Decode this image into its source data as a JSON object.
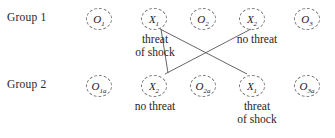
{
  "diagram": {
    "type": "experimental-design-crossover-diagram",
    "rows": [
      {
        "label": "Group 1",
        "label_x": 7,
        "label_y": 11,
        "node_y": 8,
        "nodes": [
          {
            "name": "o1",
            "base": "O",
            "sub": "1",
            "x": 86
          },
          {
            "name": "x1",
            "base": "X",
            "sub": "1",
            "x": 141
          },
          {
            "name": "o2",
            "base": "O",
            "sub": "2",
            "x": 190
          },
          {
            "name": "x2",
            "base": "X",
            "sub": "2",
            "x": 239
          },
          {
            "name": "o3",
            "base": "O",
            "sub": "3",
            "x": 294
          }
        ]
      },
      {
        "label": "Group 2",
        "label_x": 7,
        "label_y": 78,
        "node_y": 75,
        "nodes": [
          {
            "name": "o1a",
            "base": "O",
            "sub": "1a",
            "x": 86
          },
          {
            "name": "x2b",
            "base": "X",
            "sub": "2",
            "x": 141
          },
          {
            "name": "o2a",
            "base": "O",
            "sub": "2a",
            "x": 190
          },
          {
            "name": "x1b",
            "base": "X",
            "sub": "1",
            "x": 239
          },
          {
            "name": "o3a",
            "base": "O",
            "sub": "3a",
            "x": 294
          }
        ]
      }
    ],
    "captions": [
      {
        "name": "caption-top-left",
        "lines": [
          "threat",
          "of shock"
        ],
        "x": 120,
        "y": 33,
        "width": 70
      },
      {
        "name": "caption-top-right",
        "lines": [
          "no threat"
        ],
        "x": 222,
        "y": 33,
        "width": 70
      },
      {
        "name": "caption-bottom-left",
        "lines": [
          "no threat"
        ],
        "x": 120,
        "y": 100,
        "width": 70
      },
      {
        "name": "caption-bottom-right",
        "lines": [
          "threat",
          "of shock"
        ],
        "x": 222,
        "y": 100,
        "width": 70
      }
    ],
    "connectors": [
      {
        "name": "connector-x1-top-to-x2-bottom",
        "x1": 163,
        "y1": 30,
        "x2": 229,
        "y2": 78
      },
      {
        "name": "connector-x2-top-to-x1-bottom",
        "x1": 229,
        "y1": 30,
        "x2": 252,
        "y2": 78
      }
    ],
    "line_color": "#555555",
    "circle_border_color": "#7b7b7b",
    "background_color": "#ffffff"
  }
}
